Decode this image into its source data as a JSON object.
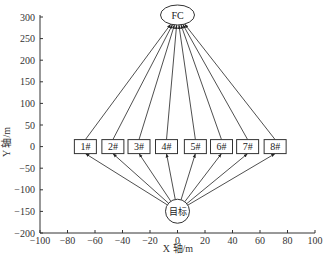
{
  "chart_data": {
    "type": "diagram",
    "title": "",
    "xlabel": "X 轴/m",
    "ylabel": "Y 轴/m",
    "xlim": [
      -100,
      100
    ],
    "ylim": [
      -200,
      300
    ],
    "xticks": [
      -100,
      -80,
      -60,
      -40,
      -20,
      0,
      20,
      40,
      60,
      80,
      100
    ],
    "yticks": [
      -200,
      -150,
      -100,
      -50,
      0,
      50,
      100,
      150,
      200,
      250,
      300
    ],
    "xtick_labels": [
      "−100",
      "−80",
      "−60",
      "−40",
      "−20",
      "0",
      "20",
      "40",
      "60",
      "80",
      "100"
    ],
    "ytick_labels": [
      "−200",
      "−150",
      "−100",
      "−50",
      "0",
      "50",
      "100",
      "150",
      "200",
      "250",
      "300"
    ],
    "fusion_center": {
      "label": "FC",
      "x": 0,
      "y": 300
    },
    "target": {
      "label": "目标",
      "x": 0,
      "y": -145
    },
    "sensors": [
      {
        "label": "1#",
        "x": -67,
        "y": 0
      },
      {
        "label": "2#",
        "x": -47,
        "y": 0
      },
      {
        "label": "3#",
        "x": -28,
        "y": 0
      },
      {
        "label": "4#",
        "x": -8,
        "y": 0
      },
      {
        "label": "5#",
        "x": 13,
        "y": 0
      },
      {
        "label": "6#",
        "x": 32,
        "y": 0
      },
      {
        "label": "7#",
        "x": 51,
        "y": 0
      },
      {
        "label": "8#",
        "x": 71,
        "y": 0
      }
    ],
    "edges": "target → each sensor; each sensor → FC"
  }
}
